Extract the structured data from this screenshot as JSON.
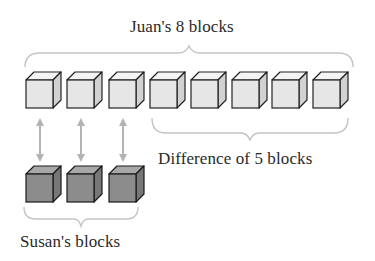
{
  "title": "Juan's 8 blocks",
  "difference_label": "Difference of 5 blocks",
  "susan_label": "Susan's blocks",
  "juan_blocks": {
    "count": 8,
    "color": "#e6e6e6"
  },
  "susan_blocks": {
    "count": 3,
    "color": "#8c8c8c"
  },
  "arrows": {
    "count": 3,
    "color": "#b4b4b4"
  },
  "brace_color": "#c4c4c4",
  "outline_color": "#222222"
}
